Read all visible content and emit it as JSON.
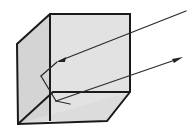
{
  "figure": {
    "width": 192,
    "height": 134,
    "background_color": "#ffffff"
  },
  "colors": {
    "face_fill": "#dcdcdc",
    "face_fill_light": "#e2e2e2",
    "face_fill_dark": "#d4d4d4",
    "outline": "#1a1a1a",
    "ray": "#2b2b2b",
    "internal_edge": "#3a3a3a"
  },
  "geometry": {
    "cube": {
      "front_face_label": "front face",
      "top_face_label": "top face",
      "left_face_label": "left face",
      "front_face_points": "50,14 130,14 130,92 107,121 50,121 50,14",
      "top_face_points": "50,14 17,44 17,121 50,121 50,14",
      "left_face_points": "17,44 50,14 130,14 130,14",
      "outline_points": "50,14 130,14 130,92 107,121 18,124 17,44 50,14",
      "top_slant_edge": "17,44 50,14",
      "vertical_left_edge": "17,44 18,124",
      "bottom_left_edge": "18,124 107,121",
      "front_left_edge": "50,14 50,121",
      "front_bottom_edge": "50,92 130,92",
      "bevel_edge": "130,92 107,121",
      "corner_diagonal": "18,124 53,92",
      "inner_vertical": "53,92 53,57",
      "inner_horizontal": "53,92 130,92"
    },
    "rays": {
      "incoming_start": "186,11",
      "incoming_end": "57,62",
      "incoming_arrow_at": "60,61",
      "outgoing_start": "56,101",
      "outgoing_end": "182,58",
      "outgoing_arrow_at": "181,58",
      "internal_segment_1": "57,62 41,76",
      "internal_segment_2": "41,76 56,101",
      "internal_segment_3": "56,101 70,104"
    }
  },
  "annotations": {
    "incoming_ray_name": "incident-ray",
    "outgoing_ray_name": "reflected-ray",
    "internal_path_name": "internal-reflection-path",
    "vertex_name": "corner-vertex"
  }
}
